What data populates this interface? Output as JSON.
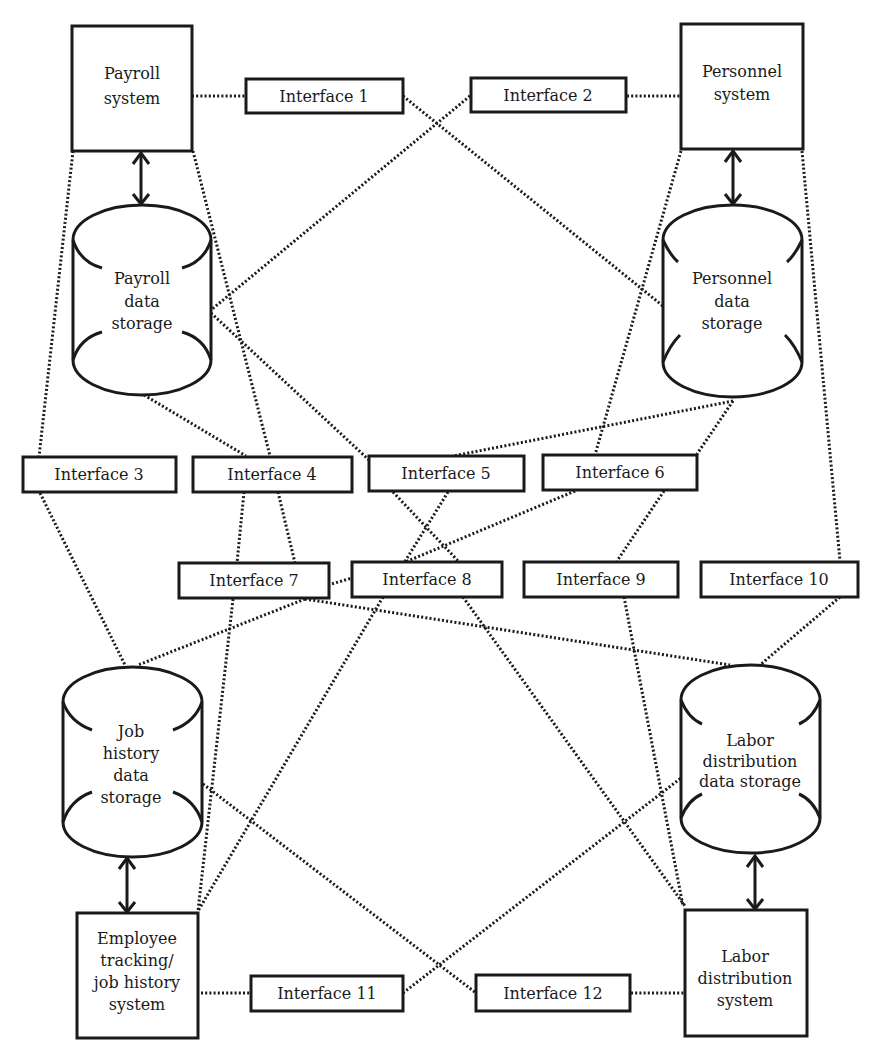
{
  "diagram": {
    "systems": [
      {
        "id": "payroll-system",
        "lines": [
          "Payroll",
          "system"
        ]
      },
      {
        "id": "personnel-system",
        "lines": [
          "Personnel",
          "system"
        ]
      },
      {
        "id": "employee-tracking-system",
        "lines": [
          "Employee",
          "tracking/",
          "job history",
          "system"
        ]
      },
      {
        "id": "labor-distribution-system",
        "lines": [
          "Labor",
          "distribution",
          "system"
        ]
      }
    ],
    "data_stores": [
      {
        "id": "payroll-data-storage",
        "lines": [
          "Payroll",
          "data",
          "storage"
        ]
      },
      {
        "id": "personnel-data-storage",
        "lines": [
          "Personnel",
          "data",
          "storage"
        ]
      },
      {
        "id": "job-history-data-storage",
        "lines": [
          "Job",
          "history",
          "data",
          "storage"
        ]
      },
      {
        "id": "labor-distribution-data-storage",
        "lines": [
          "Labor",
          "distribution",
          "data storage"
        ]
      }
    ],
    "interfaces": [
      {
        "id": "interface-1",
        "label": "Interface 1"
      },
      {
        "id": "interface-2",
        "label": "Interface 2"
      },
      {
        "id": "interface-3",
        "label": "Interface 3"
      },
      {
        "id": "interface-4",
        "label": "Interface 4"
      },
      {
        "id": "interface-5",
        "label": "Interface 5"
      },
      {
        "id": "interface-6",
        "label": "Interface 6"
      },
      {
        "id": "interface-7",
        "label": "Interface 7"
      },
      {
        "id": "interface-8",
        "label": "Interface 8"
      },
      {
        "id": "interface-9",
        "label": "Interface 9"
      },
      {
        "id": "interface-10",
        "label": "Interface 10"
      },
      {
        "id": "interface-11",
        "label": "Interface 11"
      },
      {
        "id": "interface-12",
        "label": "Interface 12"
      }
    ],
    "bidirectional_links": [
      {
        "from": "payroll-system",
        "to": "payroll-data-storage"
      },
      {
        "from": "personnel-system",
        "to": "personnel-data-storage"
      },
      {
        "from": "job-history-data-storage",
        "to": "employee-tracking-system"
      },
      {
        "from": "labor-distribution-data-storage",
        "to": "labor-distribution-system"
      }
    ],
    "interface_links": [
      {
        "interface": "interface-1",
        "connects": [
          "payroll-system",
          "personnel-data-storage"
        ]
      },
      {
        "interface": "interface-2",
        "connects": [
          "personnel-system",
          "payroll-data-storage"
        ]
      },
      {
        "interface": "interface-3",
        "connects": [
          "payroll-system",
          "job-history-data-storage"
        ]
      },
      {
        "interface": "interface-4",
        "connects": [
          "payroll-system",
          "payroll-data-storage",
          "employee-tracking-system",
          "job-history-data-storage"
        ]
      },
      {
        "interface": "interface-5",
        "connects": [
          "payroll-data-storage",
          "personnel-data-storage",
          "employee-tracking-system",
          "labor-distribution-system"
        ]
      },
      {
        "interface": "interface-6",
        "connects": [
          "personnel-system",
          "personnel-data-storage",
          "job-history-data-storage",
          "labor-distribution-system"
        ]
      },
      {
        "interface": "interface-7",
        "connects": [
          "payroll-data-storage",
          "labor-distribution-data-storage"
        ]
      },
      {
        "interface": "interface-8",
        "connects": [
          "job-history-data-storage",
          "labor-distribution-system"
        ]
      },
      {
        "interface": "interface-9",
        "connects": [
          "interface-6",
          "labor-distribution-system"
        ]
      },
      {
        "interface": "interface-10",
        "connects": [
          "personnel-system",
          "labor-distribution-data-storage"
        ]
      },
      {
        "interface": "interface-11",
        "connects": [
          "employee-tracking-system",
          "labor-distribution-data-storage"
        ]
      },
      {
        "interface": "interface-12",
        "connects": [
          "labor-distribution-system",
          "job-history-data-storage"
        ]
      }
    ]
  }
}
